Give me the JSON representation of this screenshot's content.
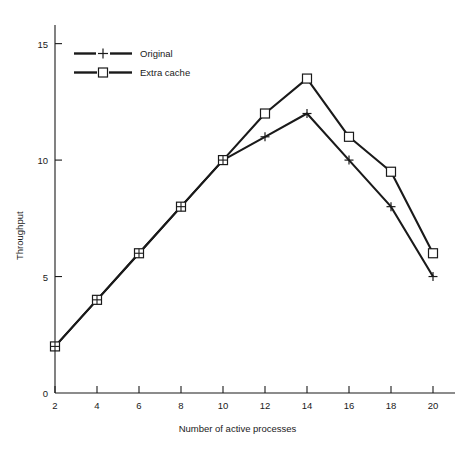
{
  "chart_data": {
    "type": "line",
    "title": "",
    "xlabel": "Number of active processes",
    "ylabel": "Throughput",
    "x": [
      2,
      4,
      6,
      8,
      10,
      12,
      14,
      16,
      18,
      20
    ],
    "xlim": [
      2,
      20
    ],
    "ylim": [
      0,
      15.8
    ],
    "xticks": [
      2,
      4,
      6,
      8,
      10,
      12,
      14,
      16,
      18,
      20
    ],
    "xtick_labels": [
      "2",
      "4",
      "6",
      "8",
      "10",
      "12",
      "14",
      "16",
      "18",
      "20"
    ],
    "yticks": [
      5,
      10,
      15
    ],
    "ytick_labels": [
      "5",
      "10",
      "15"
    ],
    "y_origin_label": "0",
    "grid": false,
    "legend_position": "upper left",
    "series": [
      {
        "name": "Original",
        "marker": "plus",
        "color": "#1a1a1a",
        "values": [
          2,
          4,
          6,
          8,
          10,
          11,
          12,
          10,
          8,
          5
        ]
      },
      {
        "name": "Extra cache",
        "marker": "square",
        "color": "#1a1a1a",
        "values": [
          2,
          4,
          6,
          8,
          10,
          12,
          13.5,
          11,
          9.5,
          6
        ]
      }
    ]
  },
  "axes": {
    "y_axis_name": "Throughput",
    "x_axis_name": "Number of active processes"
  },
  "legend": {
    "items": [
      {
        "label": "Original",
        "marker": "plus-marker"
      },
      {
        "label": "Extra cache",
        "marker": "square-marker"
      }
    ]
  }
}
